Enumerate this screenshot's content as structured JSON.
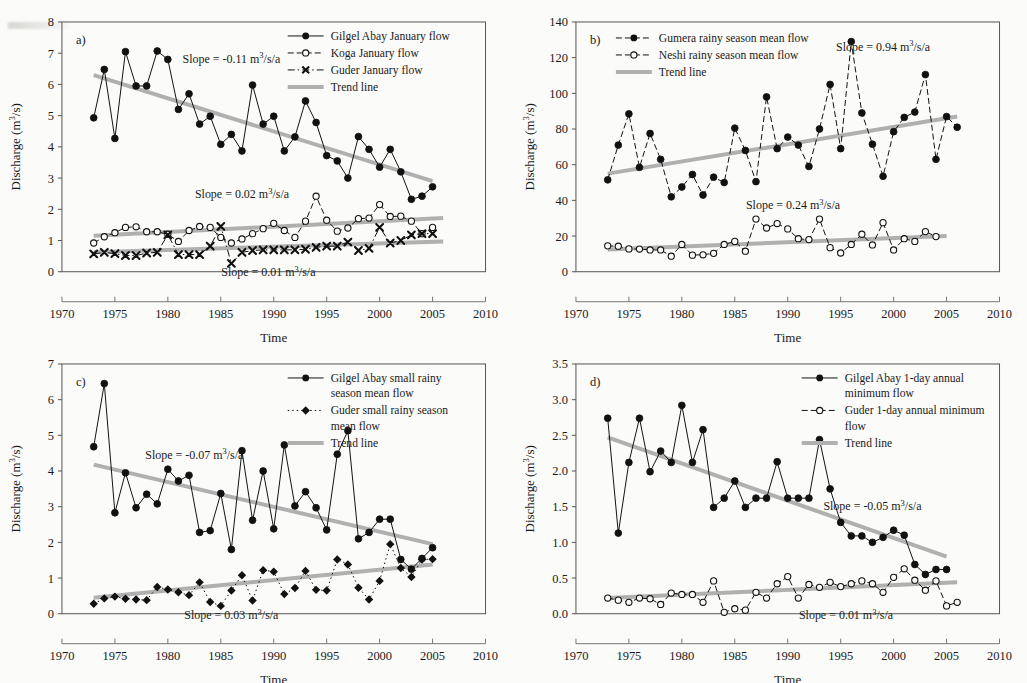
{
  "figure": {
    "axis": {
      "xlabel": "Time",
      "ylabel_prefix": "Discharge (m",
      "ylabel_sup": "3",
      "ylabel_suffix": "/s)",
      "xticks": [
        "1970",
        "1975",
        "1980",
        "1985",
        "1990",
        "1995",
        "2000",
        "2005",
        "2010"
      ],
      "xlim": [
        1970,
        2010
      ]
    },
    "trend_color": "#b0b0b0",
    "series_color": "#111111"
  },
  "chart_data": [
    {
      "id": "panel-a",
      "type": "line",
      "panel_letter": "a)",
      "title": "",
      "xlabel": "Time",
      "ylabel": "Discharge (m3/s)",
      "xlim": [
        1970,
        2010
      ],
      "ylim": [
        0,
        8
      ],
      "yticks": [
        0,
        1,
        2,
        3,
        4,
        5,
        6,
        7,
        8
      ],
      "grid": false,
      "legend_position": "top-right",
      "annotations": [
        {
          "text_prefix": "Slope = -0.11 m",
          "sup": "3",
          "text_suffix": "/s/a",
          "x": 1986.0,
          "y": 6.7
        },
        {
          "text_prefix": "Slope = 0.02 m",
          "sup": "3",
          "text_suffix": "/s/a",
          "x": 1987.0,
          "y": 2.35
        },
        {
          "text_prefix": "Slope = 0.01 m",
          "sup": "3",
          "text_suffix": "/s/a",
          "x": 1989.5,
          "y": -0.15
        }
      ],
      "x": [
        1973,
        1974,
        1975,
        1976,
        1977,
        1978,
        1979,
        1980,
        1981,
        1982,
        1983,
        1984,
        1985,
        1986,
        1987,
        1988,
        1989,
        1990,
        1991,
        1992,
        1993,
        1994,
        1995,
        1996,
        1997,
        1998,
        1999,
        2000,
        2001,
        2002,
        2003,
        2004,
        2005
      ],
      "series": [
        {
          "name": "Gilgel Abay January flow",
          "marker": "filled-circle",
          "dash": "solid",
          "values": [
            4.93,
            6.48,
            4.27,
            7.05,
            5.95,
            5.95,
            7.07,
            6.8,
            5.2,
            5.7,
            4.73,
            4.98,
            4.08,
            4.4,
            3.87,
            5.98,
            4.73,
            4.98,
            3.87,
            4.32,
            5.47,
            4.78,
            3.72,
            3.55,
            3.0,
            4.33,
            3.92,
            3.35,
            3.92,
            3.2,
            2.32,
            2.42,
            2.72
          ]
        },
        {
          "name": "Koga January flow",
          "marker": "open-circle",
          "dash": "dashed",
          "values": [
            0.92,
            1.12,
            1.25,
            1.42,
            1.44,
            1.28,
            1.28,
            1.2,
            0.97,
            1.32,
            1.45,
            1.42,
            1.1,
            0.92,
            1.05,
            1.22,
            1.38,
            1.55,
            1.32,
            1.1,
            1.62,
            2.42,
            1.65,
            1.3,
            1.4,
            1.7,
            1.72,
            2.15,
            1.77,
            1.78,
            1.62,
            1.22,
            1.42,
            1.6
          ]
        },
        {
          "name": "Guder January flow",
          "marker": "cross-x",
          "dash": "dash-dot",
          "values": [
            0.57,
            0.62,
            0.58,
            0.52,
            0.52,
            0.6,
            0.62,
            1.18,
            0.55,
            0.55,
            0.55,
            0.82,
            1.45,
            0.27,
            0.62,
            0.68,
            0.7,
            0.7,
            0.7,
            0.7,
            0.72,
            0.78,
            0.82,
            0.82,
            0.95,
            0.68,
            0.75,
            1.42,
            0.92,
            1.0,
            1.18,
            1.22,
            1.22,
            0.95,
            0.97,
            0.93,
            0.55
          ]
        },
        {
          "name": "Trend line",
          "marker": "none",
          "dash": "solid-thick",
          "trend": true
        }
      ],
      "trends": [
        {
          "x1": 1973,
          "y1": 6.3,
          "x2": 2005,
          "y2": 2.9
        },
        {
          "x1": 1973,
          "y1": 1.15,
          "x2": 2006,
          "y2": 1.72
        },
        {
          "x1": 1973,
          "y1": 0.62,
          "x2": 2006,
          "y2": 0.97
        }
      ]
    },
    {
      "id": "panel-b",
      "type": "line",
      "panel_letter": "b)",
      "title": "",
      "xlabel": "Time",
      "ylabel": "Discharge (m3/s)",
      "xlim": [
        1970,
        2010
      ],
      "ylim": [
        0,
        140
      ],
      "yticks": [
        0,
        20,
        40,
        60,
        80,
        100,
        120,
        140
      ],
      "grid": false,
      "legend_position": "top-left",
      "annotations": [
        {
          "text_prefix": "Slope = 0.94 m",
          "sup": "3",
          "text_suffix": "/s/a",
          "x": 1999.0,
          "y": 124.0
        },
        {
          "text_prefix": "Slope = 0.24 m",
          "sup": "3",
          "text_suffix": "/s/a",
          "x": 1990.5,
          "y": 35.0
        }
      ],
      "x": [
        1973,
        1974,
        1975,
        1976,
        1977,
        1978,
        1979,
        1980,
        1981,
        1982,
        1983,
        1984,
        1985,
        1986,
        1987,
        1988,
        1989,
        1990,
        1991,
        1992,
        1993,
        1994,
        1995,
        1996,
        1997,
        1998,
        1999,
        2000,
        2001,
        2002,
        2003,
        2004,
        2005,
        2006
      ],
      "series": [
        {
          "name": "Gumera rainy season mean flow",
          "marker": "filled-circle",
          "dash": "dashed",
          "values": [
            51.5,
            71.0,
            88.5,
            58.5,
            77.5,
            63.0,
            42.0,
            47.5,
            54.5,
            43.0,
            53.0,
            50.0,
            80.5,
            68.0,
            50.5,
            98.0,
            69.0,
            75.5,
            71.0,
            59.0,
            80.0,
            105.0,
            69.0,
            129.0,
            89.0,
            71.5,
            53.5,
            78.5,
            86.5,
            89.5,
            110.5,
            63.0,
            87.0,
            81.0
          ]
        },
        {
          "name": "Neshi rainy season mean flow",
          "marker": "open-circle",
          "dash": "dashed",
          "values": [
            14.5,
            14.3,
            12.8,
            12.7,
            12.2,
            12.2,
            8.7,
            15.3,
            9.3,
            9.5,
            10.3,
            15.3,
            17.0,
            11.5,
            29.5,
            24.5,
            27.0,
            24.0,
            18.5,
            18.0,
            29.5,
            13.5,
            10.5,
            15.3,
            21.0,
            15.0,
            27.5,
            12.2,
            18.5,
            17.0,
            22.5,
            19.7,
            null,
            null
          ]
        },
        {
          "name": "Trend line",
          "marker": "none",
          "dash": "solid-thick",
          "trend": true
        }
      ],
      "trends": [
        {
          "x1": 1973,
          "y1": 55.0,
          "x2": 2006,
          "y2": 87.0
        },
        {
          "x1": 1973,
          "y1": 12.5,
          "x2": 2005,
          "y2": 20.0
        }
      ]
    },
    {
      "id": "panel-c",
      "type": "line",
      "panel_letter": "c)",
      "title": "",
      "xlabel": "Time",
      "ylabel": "Discharge (m3/s)",
      "xlim": [
        1970,
        2010
      ],
      "ylim": [
        0,
        7
      ],
      "yticks": [
        0,
        1,
        2,
        3,
        4,
        5,
        6,
        7
      ],
      "grid": false,
      "legend_position": "top-right",
      "annotations": [
        {
          "text_prefix": "Slope = -0.07 m",
          "sup": "3",
          "text_suffix": "/s/a",
          "x": 1982.5,
          "y": 4.35
        },
        {
          "text_prefix": "Slope = 0.03 m",
          "sup": "3",
          "text_suffix": "/s/a",
          "x": 1986.0,
          "y": -0.15
        }
      ],
      "x": [
        1973,
        1974,
        1975,
        1976,
        1977,
        1978,
        1979,
        1980,
        1981,
        1982,
        1983,
        1984,
        1985,
        1986,
        1987,
        1988,
        1989,
        1990,
        1991,
        1992,
        1993,
        1994,
        1995,
        1996,
        1997,
        1998,
        1999,
        2000,
        2001,
        2002,
        2003,
        2004,
        2005
      ],
      "series": [
        {
          "name": "Gilgel Abay small rainy season mean flow",
          "marker": "filled-circle",
          "dash": "solid",
          "values": [
            4.68,
            6.45,
            2.83,
            3.95,
            2.97,
            3.35,
            3.08,
            4.05,
            3.72,
            3.88,
            2.28,
            2.33,
            3.37,
            1.8,
            4.57,
            2.62,
            4.0,
            2.38,
            4.73,
            3.02,
            3.42,
            2.97,
            2.35,
            4.47,
            5.13,
            2.1,
            2.28,
            2.65,
            2.65,
            1.52,
            1.25,
            1.55,
            1.85
          ]
        },
        {
          "name": "Guder small rainy season mean flow",
          "marker": "filled-diamond",
          "dash": "dotted",
          "values": [
            0.28,
            0.43,
            0.48,
            0.42,
            0.4,
            0.38,
            0.75,
            0.68,
            0.6,
            0.52,
            0.88,
            0.33,
            0.22,
            0.65,
            1.08,
            0.37,
            1.22,
            1.18,
            0.55,
            0.72,
            1.2,
            0.67,
            0.65,
            1.52,
            1.38,
            0.73,
            0.4,
            0.92,
            1.95,
            1.28,
            1.03,
            1.52,
            1.53
          ]
        },
        {
          "name": "Trend line",
          "marker": "none",
          "dash": "solid-thick",
          "trend": true
        }
      ],
      "trends": [
        {
          "x1": 1973,
          "y1": 4.18,
          "x2": 2005,
          "y2": 1.95
        },
        {
          "x1": 1973,
          "y1": 0.45,
          "x2": 2005,
          "y2": 1.38
        }
      ]
    },
    {
      "id": "panel-d",
      "type": "line",
      "panel_letter": "d)",
      "title": "",
      "xlabel": "Time",
      "ylabel": "Discharge (m3/s)",
      "xlim": [
        1970,
        2010
      ],
      "ylim": [
        0.0,
        3.5
      ],
      "yticks": [
        "0.0",
        "0.5",
        "1.0",
        "1.5",
        "2.0",
        "2.5",
        "3.0",
        "3.5"
      ],
      "grid": false,
      "legend_position": "top-right",
      "annotations": [
        {
          "text_prefix": "Slope = -0.05 m",
          "sup": "3",
          "text_suffix": "/s/a",
          "x": 1998.0,
          "y": 1.45
        },
        {
          "text_prefix": "Slope = 0.01 m",
          "sup": "3",
          "text_suffix": "/s/a",
          "x": 1995.5,
          "y": -0.08
        }
      ],
      "x": [
        1973,
        1974,
        1975,
        1976,
        1977,
        1978,
        1979,
        1980,
        1981,
        1982,
        1983,
        1984,
        1985,
        1986,
        1987,
        1988,
        1989,
        1990,
        1991,
        1992,
        1993,
        1994,
        1995,
        1996,
        1997,
        1998,
        1999,
        2000,
        2001,
        2002,
        2003,
        2004,
        2005,
        2006
      ],
      "series": [
        {
          "name": "Gilgel Abay 1-day annual minimum flow",
          "marker": "filled-circle",
          "dash": "solid",
          "values": [
            2.74,
            1.13,
            2.12,
            2.74,
            1.99,
            2.28,
            2.12,
            2.92,
            2.12,
            2.58,
            1.49,
            1.62,
            1.86,
            1.49,
            1.62,
            1.62,
            2.13,
            1.62,
            1.62,
            1.62,
            2.44,
            1.75,
            1.28,
            1.09,
            1.09,
            1.0,
            1.07,
            1.17,
            1.1,
            0.69,
            0.55,
            0.62,
            0.62,
            null
          ]
        },
        {
          "name": "Guder 1-day annual minimum flow",
          "marker": "open-circle",
          "dash": "dashed",
          "values": [
            0.22,
            0.19,
            0.16,
            0.22,
            0.21,
            0.13,
            0.29,
            0.27,
            0.27,
            0.16,
            0.46,
            0.02,
            0.07,
            0.05,
            0.3,
            0.22,
            0.42,
            0.52,
            0.22,
            0.41,
            0.37,
            0.44,
            0.38,
            0.42,
            0.46,
            0.42,
            0.3,
            0.51,
            0.63,
            0.47,
            0.33,
            0.46,
            0.11,
            0.16
          ]
        },
        {
          "name": "Trend line",
          "marker": "none",
          "dash": "solid-thick",
          "trend": true
        }
      ],
      "trends": [
        {
          "x1": 1973,
          "y1": 2.47,
          "x2": 2005,
          "y2": 0.8
        },
        {
          "x1": 1973,
          "y1": 0.22,
          "x2": 2006,
          "y2": 0.44
        }
      ]
    }
  ]
}
